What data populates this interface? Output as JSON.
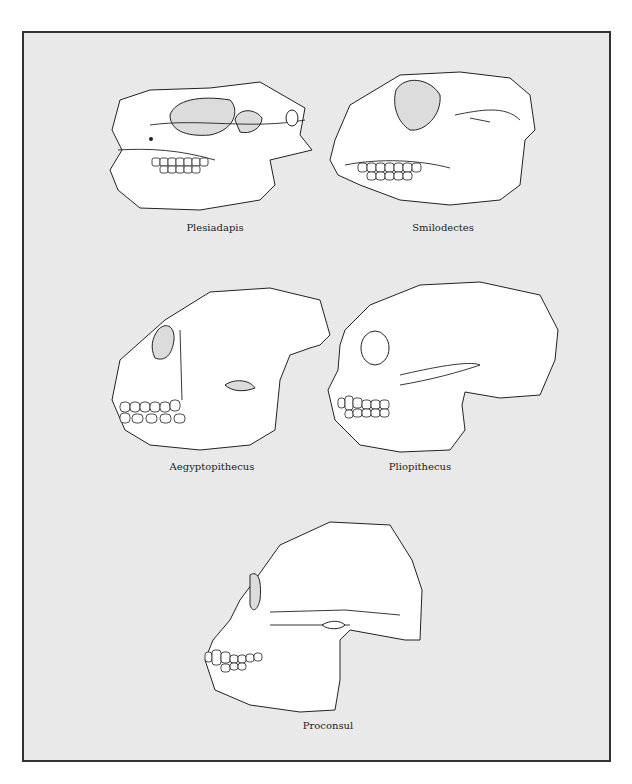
{
  "figure": {
    "specimens": [
      {
        "id": "plesiadapis",
        "label": "Plesiadapis"
      },
      {
        "id": "smilodectes",
        "label": "Smilodectes"
      },
      {
        "id": "aegyptopithecus",
        "label": "Aegyptopithecus"
      },
      {
        "id": "pliopithecus",
        "label": "Pliopithecus"
      },
      {
        "id": "proconsul",
        "label": "Proconsul"
      }
    ]
  }
}
